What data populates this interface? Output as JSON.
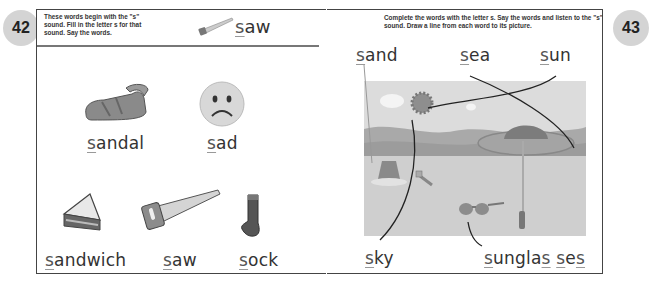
{
  "pages": {
    "left": {
      "number": "42",
      "instructions": "These words begin with the \"s\" sound. Fill in the letter s for that sound. Say the words.",
      "example": {
        "letter": "s",
        "rest": "aw",
        "icon": "saw-icon"
      },
      "words": [
        {
          "letter": "s",
          "rest": "andal",
          "icon": "sandal-icon"
        },
        {
          "letter": "s",
          "rest": "ad",
          "icon": "sad-face-icon"
        },
        {
          "letter": "s",
          "rest": "andwich",
          "icon": "sandwich-icon"
        },
        {
          "letter": "s",
          "rest": "aw",
          "icon": "saw-icon"
        },
        {
          "letter": "s",
          "rest": "ock",
          "icon": "sock-icon"
        }
      ]
    },
    "right": {
      "number": "43",
      "instructions": "Complete the words with the letter s. Say the words and listen to the \"s\" sound. Draw a line from each word to its picture.",
      "words": [
        {
          "letter": "s",
          "rest": "and"
        },
        {
          "letter": "s",
          "rest": "ea"
        },
        {
          "letter": "s",
          "rest": "un"
        },
        {
          "letter": "s",
          "rest": "ky"
        },
        {
          "parts": [
            "s",
            "ungla",
            "s",
            "s",
            "e",
            "s"
          ]
        }
      ],
      "picture": {
        "icon": "beach-scene-icon",
        "elements": [
          "sun-icon",
          "cloud-icon",
          "sea-icon",
          "sand-bucket-icon",
          "spade-icon",
          "umbrella-icon",
          "sunglasses-icon"
        ]
      }
    }
  }
}
